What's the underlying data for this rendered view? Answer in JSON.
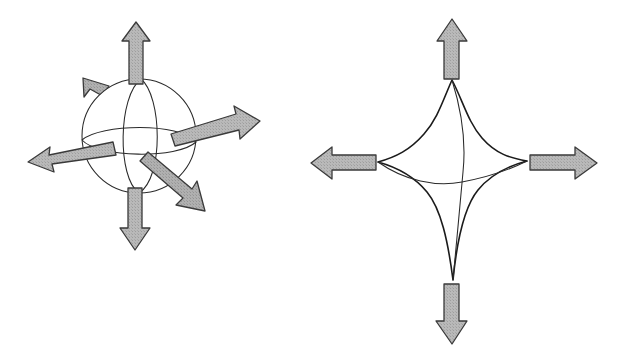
{
  "figure": {
    "background_color": "#ffffff",
    "outline_color": "#1b1b1b",
    "arrow_fill_color": "#b4b4b4",
    "arrow_stroke_color": "#3a3a3a",
    "caption": "",
    "panels": [
      {
        "id": "left",
        "name": "sphere-panel",
        "shape_label": "sphere",
        "description": "Wireframe sphere drawn in perspective with a vertical meridian and a horizontal equator, six shaded block arrows radiating outward in three dimensions",
        "center": {
          "x": 139,
          "y": 136
        },
        "radius": 57,
        "arrow_count": 6,
        "arrows": [
          {
            "name": "arrow-up",
            "direction": "up",
            "angle_deg": 90,
            "length": 72,
            "perspective": "in-plane"
          },
          {
            "name": "arrow-down",
            "direction": "down",
            "angle_deg": 270,
            "length": 66,
            "perspective": "in-plane"
          },
          {
            "name": "arrow-left",
            "direction": "left",
            "angle_deg": 186,
            "length": 92,
            "perspective": "in-plane"
          },
          {
            "name": "arrow-right",
            "direction": "right",
            "angle_deg": 9,
            "length": 96,
            "perspective": "in-plane"
          },
          {
            "name": "arrow-back-upper-left",
            "direction": "up-left",
            "angle_deg": 140,
            "length": 48,
            "perspective": "receding"
          },
          {
            "name": "arrow-front-lower-right",
            "direction": "down-right",
            "angle_deg": 316,
            "length": 70,
            "perspective": "approaching"
          }
        ]
      },
      {
        "id": "right",
        "name": "star-body-panel",
        "shape_label": "deformed body",
        "description": "Four-pointed concave star (astroid-like) body with a vertical meridian and a horizontal equator, four shaded block arrows along the principal axes",
        "center": {
          "x": 452,
          "y": 180
        },
        "tip_radius_vertical": 100,
        "tip_radius_horizontal": 100,
        "waist_factor": 0.56,
        "arrow_count": 4,
        "arrows": [
          {
            "name": "arrow-up",
            "direction": "up",
            "angle_deg": 90,
            "length": 62
          },
          {
            "name": "arrow-down",
            "direction": "down",
            "angle_deg": 270,
            "length": 62
          },
          {
            "name": "arrow-left",
            "direction": "left",
            "angle_deg": 180,
            "length": 70
          },
          {
            "name": "arrow-right",
            "direction": "right",
            "angle_deg": 0,
            "length": 70
          }
        ]
      }
    ]
  }
}
